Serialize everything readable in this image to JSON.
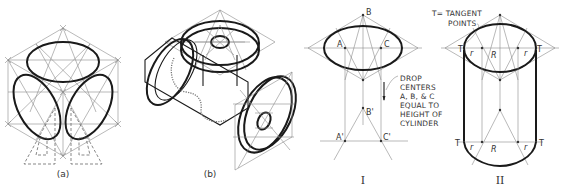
{
  "figure": {
    "panels": [
      {
        "id": "a",
        "label": "(a)"
      },
      {
        "id": "b",
        "label": "(b)"
      },
      {
        "id": "I",
        "label": "I"
      },
      {
        "id": "II",
        "label": "II"
      }
    ],
    "panel_I_points": {
      "A": "A",
      "B": "B",
      "C": "C",
      "A_prime": "A'",
      "B_prime": "B'",
      "C_prime": "C'"
    },
    "annotations": {
      "tangent_note_line1": "T= TANGENT",
      "tangent_note_line2": "POINTS",
      "drop_note_lines": [
        "DROP",
        "CENTERS",
        "A, B, & C",
        "EQUAL TO",
        "HEIGHT OF",
        "CYLINDER"
      ]
    },
    "panel_II_marks": {
      "tangent": "T",
      "radius_small": "r",
      "radius_large": "R"
    }
  }
}
